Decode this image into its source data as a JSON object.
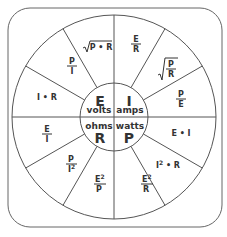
{
  "colors": {
    "line": "#555555",
    "text": "#333333",
    "background": "#ffffff"
  },
  "center": {
    "volts": {
      "symbol": "E",
      "unit": "volts"
    },
    "amps": {
      "symbol": "I",
      "unit": "amps"
    },
    "ohms": {
      "symbol": "R",
      "unit": "ohms"
    },
    "watts": {
      "symbol": "P",
      "unit": "watts"
    }
  },
  "formulas": {
    "volts": [
      {
        "id": "i-times-r",
        "text": "I • R"
      },
      {
        "id": "p-over-i",
        "num": "P",
        "den": "I"
      },
      {
        "id": "sqrt-p-times-r",
        "radicand": "P • R"
      }
    ],
    "amps": [
      {
        "id": "e-over-r",
        "num": "E",
        "den": "R"
      },
      {
        "id": "sqrt-p-over-r",
        "num": "P",
        "den": "R"
      },
      {
        "id": "p-over-e",
        "num": "P",
        "den": "E"
      }
    ],
    "watts": [
      {
        "id": "e-times-i",
        "text": "E • I"
      },
      {
        "id": "i2-times-r",
        "base": "I",
        "exp": "2",
        "rest": " • R"
      },
      {
        "id": "e2-over-r",
        "num": "E",
        "exp": "2",
        "den": "R"
      }
    ],
    "ohms": [
      {
        "id": "e2-over-p",
        "num": "E",
        "exp": "2",
        "den": "P"
      },
      {
        "id": "p-over-i2",
        "num": "P",
        "den": "I",
        "exp": "2"
      },
      {
        "id": "e-over-i",
        "num": "E",
        "den": "I"
      }
    ]
  }
}
